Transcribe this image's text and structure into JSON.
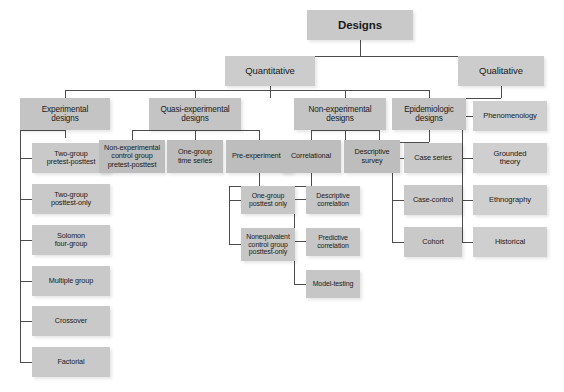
{
  "diagram": {
    "title": "Designs",
    "type": "hierarchy-tree",
    "root": {
      "label": "Designs"
    },
    "level1": [
      {
        "label": "Quantitative"
      },
      {
        "label": "Qualitative"
      }
    ],
    "level2_quantitative": [
      {
        "label": "Experimental\ndesigns"
      },
      {
        "label": "Quasi-experimental\ndesigns"
      },
      {
        "label": "Non-experimental\ndesigns"
      },
      {
        "label": "Epidemiologic\ndesigns"
      }
    ],
    "experimental_children": [
      {
        "label": "Two-group\npretest-posttest"
      },
      {
        "label": "Two-group\nposttest-only"
      },
      {
        "label": "Solomon\nfour-group"
      },
      {
        "label": "Multiple group"
      },
      {
        "label": "Crossover"
      },
      {
        "label": "Factorial"
      }
    ],
    "quasi_experimental_children": [
      {
        "label": "Non-experimental\ncontrol group\npretest-posttest"
      },
      {
        "label": "One-group\ntime series"
      },
      {
        "label": "Pre-experimental"
      }
    ],
    "pre_experimental_children": [
      {
        "label": "One-group\nposttest only"
      },
      {
        "label": "Nonequivalent\ncontrol group\nposttest-only"
      }
    ],
    "non_experimental_children": [
      {
        "label": "Correlational"
      },
      {
        "label": "Descriptive\nsurvey"
      }
    ],
    "correlational_children": [
      {
        "label": "Descriptive\ncorrelation"
      },
      {
        "label": "Predictive\ncorrelation"
      },
      {
        "label": "Model-testing"
      }
    ],
    "epidemiologic_children": [
      {
        "label": "Case series"
      },
      {
        "label": "Case-control"
      },
      {
        "label": "Cohort"
      }
    ],
    "qualitative_children": [
      {
        "label": "Phenomenology"
      },
      {
        "label": "Grounded\ntheory"
      },
      {
        "label": "Ethnography"
      },
      {
        "label": "Historical"
      }
    ],
    "colors": {
      "background": "#ffffff",
      "node_fill": "#c9c9c9",
      "connector": "#4c4c4c",
      "text": "#1a1a1a"
    }
  }
}
